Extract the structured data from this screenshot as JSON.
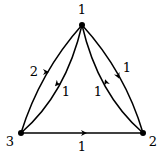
{
  "diagram": {
    "type": "directed-weighted-graph",
    "nodes": [
      {
        "id": "1",
        "label": "1",
        "x": 82,
        "y": 25,
        "label_x": 82,
        "label_y": 14
      },
      {
        "id": "2",
        "label": "2",
        "x": 143,
        "y": 133,
        "label_x": 153,
        "label_y": 144
      },
      {
        "id": "3",
        "label": "3",
        "x": 21,
        "y": 133,
        "label_x": 10,
        "label_y": 144
      }
    ],
    "edges": [
      {
        "from": "3",
        "to": "1",
        "weight": "2",
        "side": "outer-left",
        "label_x": 37,
        "label_y": 75
      },
      {
        "from": "1",
        "to": "3",
        "weight": "1",
        "side": "inner-left",
        "label_x": 66,
        "label_y": 95
      },
      {
        "from": "1",
        "to": "2",
        "weight": "1",
        "side": "outer-right",
        "label_x": 126,
        "label_y": 73
      },
      {
        "from": "2",
        "to": "1",
        "weight": "1",
        "side": "inner-right",
        "label_x": 97,
        "label_y": 95
      },
      {
        "from": "3",
        "to": "2",
        "weight": "1",
        "side": "bottom",
        "label_x": 82,
        "label_y": 150
      }
    ],
    "colors": {
      "stroke": "#000000",
      "background": "#ffffff"
    }
  }
}
